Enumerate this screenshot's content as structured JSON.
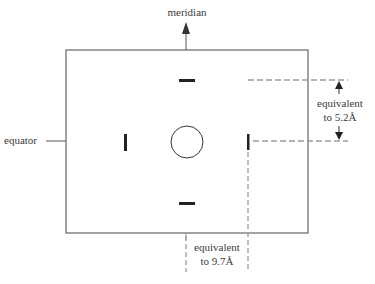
{
  "diagram": {
    "labels": {
      "meridian": "meridian",
      "equator": "equator",
      "right_annotation_line1": "equivalent",
      "right_annotation_line2": "to 5.2Å",
      "bottom_annotation_line1": "equivalent",
      "bottom_annotation_line2": "to 9.7Å"
    },
    "elements": {
      "frame": "rectangular film frame",
      "center": "undiffracted beam stop (circle)",
      "meridional_reflections": [
        "top arc",
        "bottom arc"
      ],
      "equatorial_reflections": [
        "left arc",
        "right arc"
      ]
    },
    "colors": {
      "line": "#555555",
      "reflection": "#222222",
      "dashed": "#9a9a9a"
    }
  }
}
